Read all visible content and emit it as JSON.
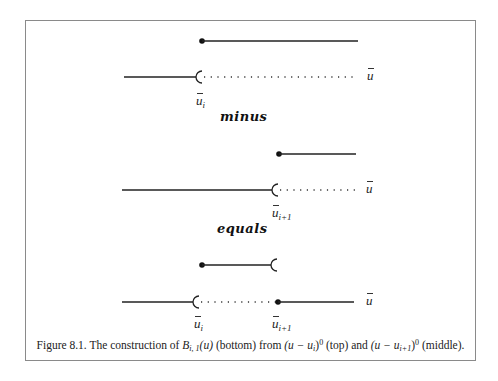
{
  "figure": {
    "rows": [
      {
        "id": "top-function",
        "closed_dot_x": 202,
        "line_end_x": 358,
        "y": 41
      },
      {
        "id": "top-axis",
        "solid_start_x": 124,
        "bracket_x": 199,
        "dots_end_x": 358,
        "y": 77,
        "axis_label": "u",
        "break_label": "u",
        "break_label_sub": "i"
      },
      {
        "id": "middle-function",
        "closed_dot_x": 279,
        "line_end_x": 356,
        "y": 154
      },
      {
        "id": "middle-axis",
        "solid_start_x": 122,
        "bracket_x": 275,
        "dots_end_x": 358,
        "y": 190,
        "axis_label": "u",
        "break_label": "u",
        "break_label_sub": "i+1"
      },
      {
        "id": "bottom-function",
        "closed_dot_x": 202,
        "bracket_x": 274,
        "y": 265
      },
      {
        "id": "bottom-axis",
        "solid_start_x": 122,
        "bracket_x": 196,
        "closed_dot_x": 278,
        "line_end_x": 354,
        "y": 302,
        "axis_label": "u",
        "break_labels": [
          {
            "label": "u",
            "sub": "i"
          },
          {
            "label": "u",
            "sub": "i+1"
          }
        ]
      }
    ],
    "operators": {
      "minus": "minus",
      "equals": "equals"
    },
    "caption": {
      "prefix": "Figure 8.1.  The construction of ",
      "B": "B",
      "B_sub": "i, 1",
      "B_arg": "(u)",
      "bottom": " (bottom) from ",
      "term1": "(u − u",
      "term1_sub": "i",
      "term1_close": ")",
      "term1_sup": "0",
      "term1_subplus": "+",
      "top": " (top) and ",
      "term2": "(u − u",
      "term2_sub": "i+1",
      "term2_close": ")",
      "term2_sup": "0",
      "term2_subplus": "+",
      "middle": " (middle)."
    }
  }
}
